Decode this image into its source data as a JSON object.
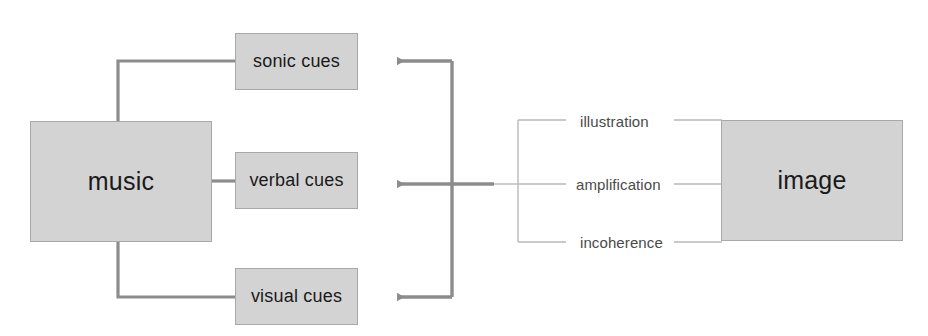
{
  "diagram": {
    "colors": {
      "node_fill": "#d3d3d3",
      "node_border": "#a8a8a8",
      "connector_dark": "#8c8c8c",
      "connector_light": "#b9b9b9",
      "text": "#1a1a1a",
      "label_text": "#4a4a4a",
      "background": "#ffffff"
    },
    "nodes": {
      "music": {
        "label": "music"
      },
      "image": {
        "label": "image"
      },
      "cues": [
        {
          "id": "sonic",
          "label": "sonic cues"
        },
        {
          "id": "verbal",
          "label": "verbal cues"
        },
        {
          "id": "visual",
          "label": "visual cues"
        }
      ]
    },
    "relations": [
      {
        "id": "illustration",
        "label": "illustration"
      },
      {
        "id": "amplification",
        "label": "amplification"
      },
      {
        "id": "incoherence",
        "label": "incoherence"
      }
    ]
  }
}
